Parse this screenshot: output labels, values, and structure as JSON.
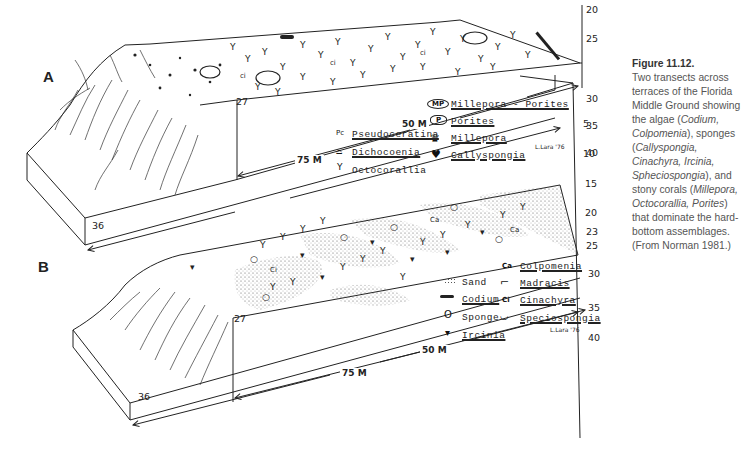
{
  "figure": {
    "number": "Figure 11.12.",
    "caption_parts": {
      "p1": "Two transects across terraces of the Florida Middle Ground showing the algae (",
      "codium": "Codium,",
      "colpomenia": "Colpomenia",
      "p2": "), sponges (",
      "sponges": "Callyspongia, Cinachyra, Ircinia, Spheciospongia",
      "p3": "), and stony corals (",
      "corals": "Millepora, Octocorallia, Porites",
      "p4": ") that dominate the hard-bottom assemblages. (From Norman 1981.)"
    }
  },
  "panel_a": {
    "label": "A",
    "depth_front": "36",
    "depth_corner": "27",
    "scale_ticks": [
      "20",
      "25",
      "30",
      "35",
      "40"
    ],
    "dim_50": "50 M",
    "dim_75": "75 M",
    "signature": "L.Lara '76",
    "legend": [
      {
        "symbol": "MP",
        "label": "Millepora - Porites",
        "underline": true
      },
      {
        "symbol": "P",
        "label": "Porites",
        "underline": true
      },
      {
        "symbol": "millepora-glyph",
        "label": "Millepora",
        "underline": true
      },
      {
        "symbol": "callyspongia-glyph",
        "label": "Callyspongia",
        "underline": true
      },
      {
        "symbol": "Pc",
        "label": "Pseudoceratina",
        "underline": true
      },
      {
        "symbol": "dichocoenia-glyph",
        "label": "Dichocoenia",
        "underline": true
      },
      {
        "symbol": "octocorallia-glyph",
        "label": "Octocorallia",
        "underline": false
      }
    ]
  },
  "right_scale": {
    "ticks": [
      "5",
      "10",
      "15",
      "20",
      "23",
      "25",
      "30",
      "35",
      "40"
    ]
  },
  "panel_b": {
    "label": "B",
    "depth_front": "36",
    "depth_corner": "27",
    "dim_50": "50 M",
    "dim_75": "75 M",
    "signature": "L.Lara '76",
    "legend": [
      {
        "symbol": "sand-stipple",
        "label": "Sand",
        "underline": false
      },
      {
        "symbol": "codium-glyph",
        "label": "Codium",
        "underline": true
      },
      {
        "symbol": "O",
        "label": "Sponge",
        "underline": false
      },
      {
        "symbol": "ircinia-glyph",
        "label": "Ircinia",
        "underline": true
      },
      {
        "symbol": "Ca",
        "label": "Colpomenia",
        "underline": true
      },
      {
        "symbol": "madracis-glyph",
        "label": "Madracis",
        "underline": true
      },
      {
        "symbol": "Ci",
        "label": "Cinachyra",
        "underline": true
      },
      {
        "symbol": "speciospongia-glyph",
        "label": "Speciospongia",
        "underline": true
      }
    ]
  }
}
